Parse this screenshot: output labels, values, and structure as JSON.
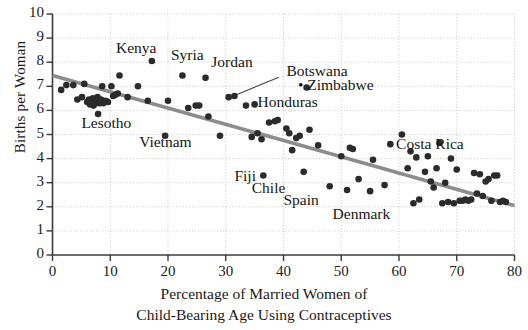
{
  "chart_data": {
    "type": "scatter",
    "title": "",
    "xlabel": "Percentage of Married Women of Child-Bearing Age Using Contraceptives",
    "xlabel_line1": "Percentage of Married Women of",
    "xlabel_line2": "Child-Bearing Age Using Contraceptives",
    "ylabel": "Births per Woman",
    "xlim": [
      0,
      80
    ],
    "ylim": [
      0,
      10
    ],
    "xticks": [
      0,
      10,
      20,
      30,
      40,
      50,
      60,
      70,
      80
    ],
    "yticks": [
      0,
      1,
      2,
      3,
      4,
      5,
      6,
      7,
      8,
      9,
      10
    ],
    "grid": true,
    "grid_style": "dotted",
    "legend": "none",
    "point_color": "#2b2b2b",
    "trendline_color": "#8c8c8c",
    "trendline": {
      "type": "linear-fit",
      "x_start": 0,
      "y_start": 7.45,
      "x_end": 80,
      "y_end": 2.05
    },
    "annotations": [
      {
        "text": "Kenya",
        "x": 11.0,
        "y": 8.55,
        "anchor": "start"
      },
      {
        "text": "Syria",
        "x": 20.5,
        "y": 8.25,
        "anchor": "start"
      },
      {
        "text": "Jordan",
        "x": 27.5,
        "y": 7.95,
        "anchor": "start"
      },
      {
        "text": "Botswana",
        "x": 40.5,
        "y": 7.6,
        "anchor": "start",
        "leader": true
      },
      {
        "text": "Zimbabwe",
        "x": 42.5,
        "y": 7.0,
        "anchor": "start",
        "marker": true
      },
      {
        "text": "Honduras",
        "x": 35.5,
        "y": 6.3,
        "anchor": "start"
      },
      {
        "text": "Lesotho",
        "x": 5.0,
        "y": 5.45,
        "anchor": "start"
      },
      {
        "text": "Vietnam",
        "x": 15.0,
        "y": 4.65,
        "anchor": "start"
      },
      {
        "text": "Costa Rica",
        "x": 59.5,
        "y": 4.55,
        "anchor": "start"
      },
      {
        "text": "Fiji",
        "x": 31.5,
        "y": 3.25,
        "anchor": "start"
      },
      {
        "text": "Chile",
        "x": 34.5,
        "y": 2.75,
        "anchor": "start"
      },
      {
        "text": "Spain",
        "x": 40.0,
        "y": 2.25,
        "anchor": "start"
      },
      {
        "text": "Denmark",
        "x": 48.5,
        "y": 1.65,
        "anchor": "start"
      }
    ],
    "points": [
      {
        "x": 1.5,
        "y": 6.85
      },
      {
        "x": 2.4,
        "y": 7.05
      },
      {
        "x": 3.6,
        "y": 7.05
      },
      {
        "x": 4.3,
        "y": 6.45
      },
      {
        "x": 5.1,
        "y": 6.55
      },
      {
        "x": 5.5,
        "y": 7.1
      },
      {
        "x": 6.0,
        "y": 6.35
      },
      {
        "x": 6.3,
        "y": 6.45
      },
      {
        "x": 6.5,
        "y": 6.25
      },
      {
        "x": 6.8,
        "y": 6.35
      },
      {
        "x": 7.0,
        "y": 6.5
      },
      {
        "x": 7.1,
        "y": 6.2
      },
      {
        "x": 7.4,
        "y": 6.4
      },
      {
        "x": 7.6,
        "y": 6.3
      },
      {
        "x": 7.8,
        "y": 6.55
      },
      {
        "x": 7.9,
        "y": 5.85
      },
      {
        "x": 8.2,
        "y": 6.3
      },
      {
        "x": 8.4,
        "y": 6.45
      },
      {
        "x": 8.6,
        "y": 7.0
      },
      {
        "x": 8.8,
        "y": 6.3
      },
      {
        "x": 9.2,
        "y": 6.4
      },
      {
        "x": 9.6,
        "y": 6.35
      },
      {
        "x": 10.2,
        "y": 7.0
      },
      {
        "x": 10.5,
        "y": 6.6
      },
      {
        "x": 10.9,
        "y": 6.65
      },
      {
        "x": 11.3,
        "y": 6.7
      },
      {
        "x": 11.6,
        "y": 7.45
      },
      {
        "x": 13.0,
        "y": 6.55
      },
      {
        "x": 14.8,
        "y": 7.0
      },
      {
        "x": 16.5,
        "y": 6.4
      },
      {
        "x": 17.2,
        "y": 8.05
      },
      {
        "x": 19.5,
        "y": 4.95
      },
      {
        "x": 20.0,
        "y": 6.4
      },
      {
        "x": 22.5,
        "y": 7.45
      },
      {
        "x": 23.5,
        "y": 6.1
      },
      {
        "x": 24.8,
        "y": 6.2
      },
      {
        "x": 25.4,
        "y": 6.2
      },
      {
        "x": 26.5,
        "y": 7.35
      },
      {
        "x": 27.0,
        "y": 5.75
      },
      {
        "x": 29.0,
        "y": 4.95
      },
      {
        "x": 31.5,
        "y": 6.6
      },
      {
        "x": 33.5,
        "y": 6.2
      },
      {
        "x": 34.5,
        "y": 4.9
      },
      {
        "x": 35.5,
        "y": 5.05
      },
      {
        "x": 36.2,
        "y": 4.8
      },
      {
        "x": 36.5,
        "y": 3.3
      },
      {
        "x": 37.5,
        "y": 5.5
      },
      {
        "x": 38.5,
        "y": 5.55
      },
      {
        "x": 39.0,
        "y": 5.6
      },
      {
        "x": 40.5,
        "y": 5.25
      },
      {
        "x": 41.0,
        "y": 5.05
      },
      {
        "x": 41.5,
        "y": 4.35
      },
      {
        "x": 42.2,
        "y": 4.85
      },
      {
        "x": 42.8,
        "y": 4.95
      },
      {
        "x": 43.5,
        "y": 3.45
      },
      {
        "x": 44.5,
        "y": 5.2
      },
      {
        "x": 46.0,
        "y": 4.55
      },
      {
        "x": 48.0,
        "y": 2.85
      },
      {
        "x": 50.0,
        "y": 4.1
      },
      {
        "x": 51.0,
        "y": 2.7
      },
      {
        "x": 51.5,
        "y": 4.45
      },
      {
        "x": 52.0,
        "y": 4.4
      },
      {
        "x": 53.0,
        "y": 3.15
      },
      {
        "x": 55.0,
        "y": 2.65
      },
      {
        "x": 55.5,
        "y": 3.95
      },
      {
        "x": 57.5,
        "y": 2.9
      },
      {
        "x": 58.5,
        "y": 4.6
      },
      {
        "x": 60.5,
        "y": 5.0
      },
      {
        "x": 61.5,
        "y": 3.6
      },
      {
        "x": 62.0,
        "y": 4.3
      },
      {
        "x": 62.5,
        "y": 2.15
      },
      {
        "x": 63.0,
        "y": 4.05
      },
      {
        "x": 63.5,
        "y": 2.3
      },
      {
        "x": 64.5,
        "y": 3.45
      },
      {
        "x": 65.0,
        "y": 4.1
      },
      {
        "x": 65.5,
        "y": 3.05
      },
      {
        "x": 66.0,
        "y": 2.8
      },
      {
        "x": 66.5,
        "y": 3.6
      },
      {
        "x": 67.0,
        "y": 4.65
      },
      {
        "x": 67.5,
        "y": 2.15
      },
      {
        "x": 68.0,
        "y": 3.0
      },
      {
        "x": 68.5,
        "y": 2.2
      },
      {
        "x": 69.0,
        "y": 4.0
      },
      {
        "x": 69.5,
        "y": 2.15
      },
      {
        "x": 70.0,
        "y": 3.55
      },
      {
        "x": 70.5,
        "y": 2.25
      },
      {
        "x": 71.0,
        "y": 2.25
      },
      {
        "x": 71.5,
        "y": 2.3
      },
      {
        "x": 72.0,
        "y": 2.25
      },
      {
        "x": 72.5,
        "y": 2.3
      },
      {
        "x": 73.0,
        "y": 3.4
      },
      {
        "x": 73.5,
        "y": 2.55
      },
      {
        "x": 74.0,
        "y": 3.35
      },
      {
        "x": 74.5,
        "y": 2.45
      },
      {
        "x": 75.0,
        "y": 3.05
      },
      {
        "x": 75.5,
        "y": 3.15
      },
      {
        "x": 76.0,
        "y": 2.25
      },
      {
        "x": 76.5,
        "y": 3.3
      },
      {
        "x": 77.0,
        "y": 3.3
      },
      {
        "x": 77.5,
        "y": 2.2
      },
      {
        "x": 78.0,
        "y": 2.25
      },
      {
        "x": 78.5,
        "y": 2.2
      },
      {
        "x": 44.0,
        "y": 6.95
      },
      {
        "x": 30.5,
        "y": 6.55
      },
      {
        "x": 35.0,
        "y": 6.25
      }
    ]
  }
}
